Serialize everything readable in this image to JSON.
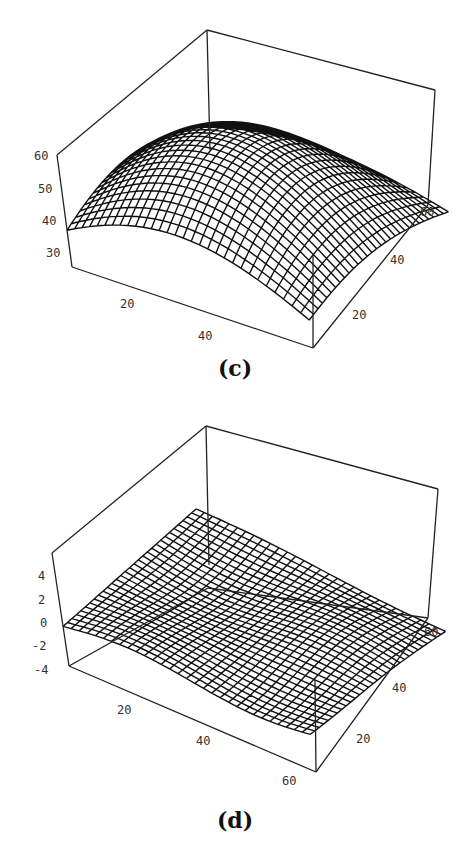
{
  "chart_data": [
    {
      "type": "surface3d",
      "panel_label": "(c)",
      "title": "",
      "xlabel": "",
      "ylabel": "",
      "zlabel": "",
      "x_ticks": [
        "20",
        "40",
        "60"
      ],
      "y_ticks": [
        "20",
        "40",
        "60"
      ],
      "z_ticks": [
        "30",
        "40",
        "50",
        "60"
      ],
      "xlim": [
        0,
        64
      ],
      "ylim": [
        0,
        64
      ],
      "zlim": [
        24,
        60
      ],
      "grid_resolution": 30,
      "surface_description": "Smooth dome-shaped surface, peak ~60 near center-back, falling to ~27 at the front-left and front-right edges",
      "sample_values": {
        "corner_front_left": 27,
        "center": 58,
        "peak": 60,
        "back_right_edge": 45,
        "front_right_edge": 28
      }
    },
    {
      "type": "surface3d",
      "panel_label": "(d)",
      "title": "",
      "xlabel": "",
      "ylabel": "",
      "zlabel": "",
      "x_ticks": [
        "20",
        "40",
        "60"
      ],
      "y_ticks": [
        "20",
        "40",
        "60"
      ],
      "z_ticks": [
        "-4",
        "-2",
        "0",
        "2",
        "4"
      ],
      "xlim": [
        0,
        64
      ],
      "ylim": [
        0,
        64
      ],
      "zlim": [
        -5,
        5
      ],
      "grid_resolution": 30,
      "surface_description": "Nearly flat gently undulating surface, values between about -2 and 3",
      "sample_values": {
        "corner_front_left": -2,
        "center": 0.5,
        "peak": 3,
        "back_right_edge": 1,
        "front_right_edge": -1
      }
    }
  ],
  "panels": {
    "c": {
      "caption": "(c)",
      "z_ticks": [
        "60",
        "50",
        "40",
        "30"
      ],
      "x_ticks": [
        "20",
        "40",
        "60"
      ],
      "y_ticks": [
        "20",
        "40",
        "60"
      ]
    },
    "d": {
      "caption": "(d)",
      "z_ticks": [
        "4",
        "2",
        "0",
        "-2",
        "-4"
      ],
      "x_ticks": [
        "20",
        "40",
        "60"
      ],
      "y_ticks": [
        "20",
        "40",
        "60"
      ]
    }
  }
}
